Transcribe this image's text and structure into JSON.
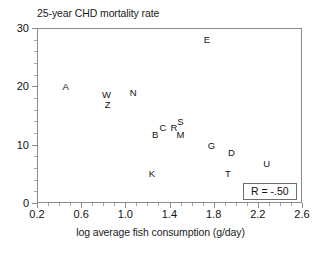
{
  "chart_data": {
    "type": "scatter",
    "title": "25-year CHD mortality rate",
    "xlabel": "log average fish consumption (g/day)",
    "ylabel": "",
    "xlim": [
      0.2,
      2.6
    ],
    "ylim": [
      0,
      30
    ],
    "xticks": [
      "0.2",
      "0.6",
      "1.0",
      "1.4",
      "1.8",
      "2.2",
      "2.6"
    ],
    "xtick_values": [
      0.2,
      0.6,
      1.0,
      1.4,
      1.8,
      2.2,
      2.6
    ],
    "yticks": [
      "0",
      "10",
      "20",
      "30"
    ],
    "ytick_values": [
      0,
      10,
      20,
      30
    ],
    "grid": false,
    "legend": null,
    "marker_style": "letter-label",
    "points": [
      {
        "label": "A",
        "x": 0.46,
        "y": 19.9
      },
      {
        "label": "W",
        "x": 0.83,
        "y": 18.5
      },
      {
        "label": "Z",
        "x": 0.84,
        "y": 16.8
      },
      {
        "label": "N",
        "x": 1.07,
        "y": 18.9
      },
      {
        "label": "E",
        "x": 1.74,
        "y": 28.0
      },
      {
        "label": "B",
        "x": 1.27,
        "y": 11.7
      },
      {
        "label": "C",
        "x": 1.34,
        "y": 12.9
      },
      {
        "label": "R",
        "x": 1.44,
        "y": 12.9
      },
      {
        "label": "S",
        "x": 1.5,
        "y": 13.9
      },
      {
        "label": "M",
        "x": 1.5,
        "y": 11.7
      },
      {
        "label": "G",
        "x": 1.78,
        "y": 9.8
      },
      {
        "label": "D",
        "x": 1.96,
        "y": 8.6
      },
      {
        "label": "U",
        "x": 2.28,
        "y": 6.7
      },
      {
        "label": "T",
        "x": 1.93,
        "y": 4.9
      },
      {
        "label": "K",
        "x": 1.24,
        "y": 4.9
      }
    ],
    "annotations": [
      {
        "name": "correlation",
        "text": "R = -.50"
      }
    ]
  }
}
